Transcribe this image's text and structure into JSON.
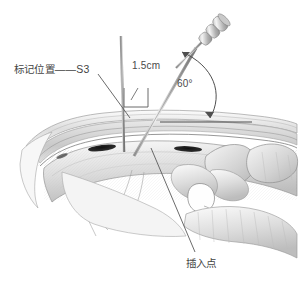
{
  "figure": {
    "background_color": "#ffffff",
    "ink_color": "#4a4a4a",
    "width": 299,
    "height": 286
  },
  "labels": {
    "mark_position": "标记位置——S3",
    "depth": "1.5cm",
    "angle": "60°",
    "entry_point": "插入点"
  },
  "icons": {
    "needle": "needle-icon",
    "arc": "angle-arc-icon",
    "bracket": "dimension-bracket-icon",
    "leader": "leader-line-icon"
  },
  "anatomy": {
    "regions": [
      "skin-layer",
      "subcutaneous-fascia-layer",
      "sacrum",
      "sacral-foramen-s3-left",
      "sacral-foramen-s3-right",
      "coccyx",
      "lumbar-vertebra",
      "ligament-fibers"
    ]
  },
  "measurements": {
    "needle_angle_degrees": 60,
    "marker_offset_cm": 1.5,
    "target_level": "S3"
  }
}
